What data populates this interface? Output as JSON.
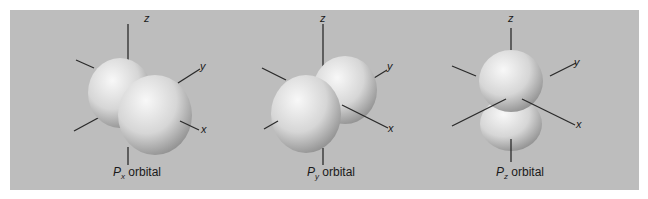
{
  "figures": [
    {
      "id": "px",
      "label_main": "P",
      "label_sub": "x",
      "label_rest": " orbital",
      "axes": {
        "z": "z",
        "y": "y",
        "x": "x"
      }
    },
    {
      "id": "py",
      "label_main": "P",
      "label_sub": "y",
      "label_rest": " orbital",
      "axes": {
        "z": "z",
        "y": "y",
        "x": "x"
      }
    },
    {
      "id": "pz",
      "label_main": "P",
      "label_sub": "z",
      "label_rest": " orbital",
      "axes": {
        "z": "z",
        "y": "y",
        "x": "x"
      }
    }
  ],
  "colors": {
    "background": "#bdbdbd",
    "lobe_light": "#f4f4f4",
    "lobe_dark": "#8e8e8e",
    "axis": "#2a2a2a"
  }
}
